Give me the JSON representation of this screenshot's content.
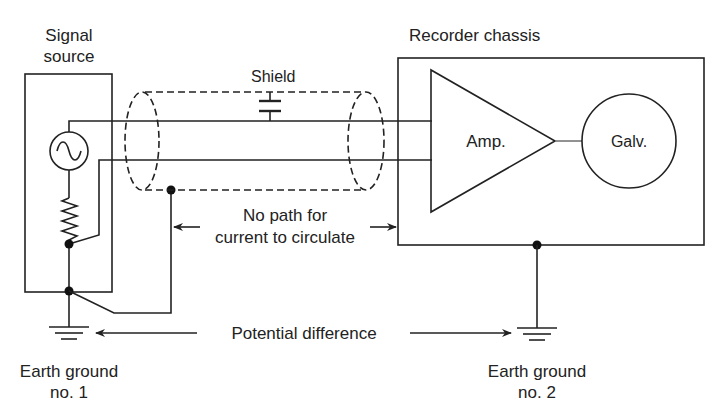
{
  "diagram": {
    "labels": {
      "signal_source_line1": "Signal",
      "signal_source_line2": "source",
      "recorder_chassis": "Recorder chassis",
      "shield": "Shield",
      "amp": "Amp.",
      "galv": "Galv.",
      "no_path_line1": "No path for",
      "no_path_line2": "current to circulate",
      "potential_difference": "Potential difference",
      "earth_ground_1_line1": "Earth ground",
      "earth_ground_1_line2": "no. 1",
      "earth_ground_2_line1": "Earth ground",
      "earth_ground_2_line2": "no. 2"
    },
    "components": [
      {
        "id": "signal-source-box",
        "type": "enclosure"
      },
      {
        "id": "ac-source",
        "type": "ac-voltage-source",
        "icon": "sine-wave-circle"
      },
      {
        "id": "source-resistor",
        "type": "resistor"
      },
      {
        "id": "shielded-cable",
        "type": "shielded-twin-lead"
      },
      {
        "id": "shield-capacitance",
        "type": "capacitor"
      },
      {
        "id": "amplifier",
        "type": "amplifier-triangle"
      },
      {
        "id": "galvanometer",
        "type": "circle"
      },
      {
        "id": "recorder-chassis-box",
        "type": "enclosure"
      },
      {
        "id": "earth-ground-1",
        "type": "ground"
      },
      {
        "id": "earth-ground-2",
        "type": "ground"
      }
    ],
    "colors": {
      "line": "#222222",
      "background": "#ffffff"
    }
  }
}
